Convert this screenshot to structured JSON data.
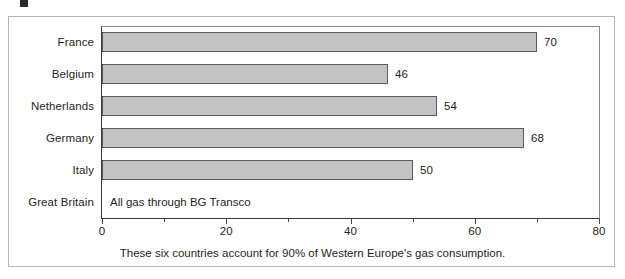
{
  "chart_data": {
    "type": "bar",
    "orientation": "horizontal",
    "title": "",
    "xlabel": "",
    "ylabel": "",
    "xlim": [
      0,
      80
    ],
    "xticks": [
      0,
      20,
      40,
      60,
      80
    ],
    "xtick_labels": [
      "0",
      "20",
      "40",
      "60",
      "80"
    ],
    "minor_xticks": [
      10,
      30,
      50,
      70
    ],
    "grid": false,
    "legend": null,
    "categories": [
      "France",
      "Belgium",
      "Netherlands",
      "Germany",
      "Italy",
      "Great Britain"
    ],
    "values": [
      70,
      46,
      54,
      68,
      50,
      null
    ],
    "value_labels": [
      "70",
      "46",
      "54",
      "68",
      "50",
      ""
    ],
    "annotations": [
      {
        "category": "Great Britain",
        "text": "All gas through BG Transco"
      }
    ],
    "caption": "These six countries account for 90% of Western Europe's gas consumption.",
    "colors": {
      "bar_fill": "#c3c3c3",
      "bar_border": "#5d5b5a",
      "axis": "#3c3a39",
      "text": "#231f20",
      "frame": "#b9b6b4",
      "background": "#ffffff"
    }
  },
  "rows": [
    {
      "label": "France",
      "value_label": "70"
    },
    {
      "label": "Belgium",
      "value_label": "46"
    },
    {
      "label": "Netherlands",
      "value_label": "54"
    },
    {
      "label": "Germany",
      "value_label": "68"
    },
    {
      "label": "Italy",
      "value_label": "50"
    },
    {
      "label": "Great Britain",
      "value_label": "",
      "note": "All gas through BG Transco"
    }
  ],
  "axis": {
    "labels": [
      "0",
      "20",
      "40",
      "60",
      "80"
    ]
  },
  "caption": "These six countries account for 90% of Western Europe's gas consumption."
}
